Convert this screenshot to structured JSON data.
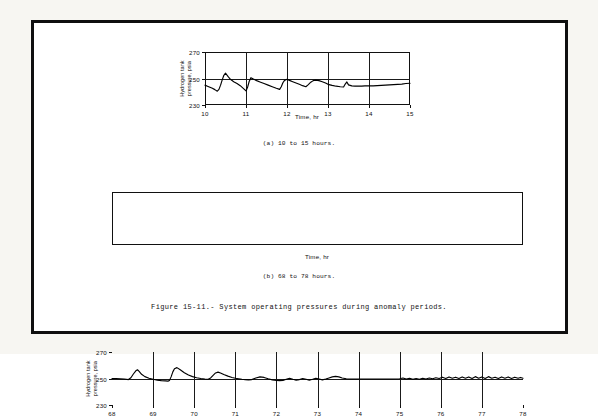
{
  "document": {
    "caption": "Figure 15-11.- System operating pressures during anomaly periods."
  },
  "chart_data": [
    {
      "id": "chart-a",
      "type": "line",
      "title": "",
      "subcaption": "(a) 10 to 15 hours.",
      "xlabel": "Time, hr",
      "ylabel": "Hydrogen tank pressure, psia",
      "ylabel_line1": "Hydrogen tank",
      "ylabel_line2": "pressure, psia",
      "xlim": [
        10,
        15
      ],
      "ylim": [
        230,
        270
      ],
      "xticks": [
        10,
        11,
        12,
        13,
        14,
        15
      ],
      "yticks": [
        230,
        250,
        270
      ],
      "grid": "vertical-at-xticks plus horizontal at 250",
      "series_name": "Hydrogen tank pressure",
      "x": [
        10.0,
        10.06,
        10.12,
        10.18,
        10.24,
        10.3,
        10.34,
        10.38,
        10.42,
        10.46,
        10.5,
        10.56,
        10.62,
        10.7,
        10.78,
        10.86,
        10.94,
        11.0,
        11.04,
        11.08,
        11.12,
        11.18,
        11.26,
        11.34,
        11.44,
        11.54,
        11.64,
        11.74,
        11.82,
        11.86,
        11.9,
        11.94,
        12.0,
        12.06,
        12.14,
        12.22,
        12.3,
        12.38,
        12.46,
        12.52,
        12.58,
        12.64,
        12.7,
        12.78,
        12.86,
        12.94,
        13.0,
        13.1,
        13.2,
        13.3,
        13.38,
        13.42,
        13.46,
        13.5,
        13.58,
        13.66,
        13.74,
        13.82,
        13.9,
        14.0,
        14.1,
        14.2,
        14.3,
        14.4,
        14.5,
        14.6,
        14.7,
        14.8,
        14.9,
        15.0
      ],
      "y": [
        245.0,
        244.2,
        243.4,
        242.6,
        241.6,
        240.4,
        241.8,
        245.0,
        249.0,
        252.4,
        254.0,
        251.6,
        249.4,
        247.6,
        246.2,
        244.6,
        242.4,
        240.6,
        243.6,
        248.0,
        250.6,
        249.6,
        248.4,
        247.4,
        246.2,
        245.0,
        243.8,
        242.6,
        241.8,
        243.8,
        246.8,
        248.6,
        249.4,
        248.6,
        247.6,
        246.6,
        245.6,
        244.6,
        243.8,
        245.4,
        247.2,
        248.4,
        248.8,
        248.4,
        247.6,
        246.6,
        245.6,
        244.8,
        244.2,
        243.8,
        243.6,
        245.8,
        247.4,
        245.2,
        244.4,
        244.2,
        244.2,
        244.2,
        244.4,
        244.4,
        244.4,
        244.6,
        244.8,
        245.0,
        245.2,
        245.4,
        245.6,
        245.8,
        246.2,
        246.4
      ]
    },
    {
      "id": "chart-b",
      "type": "line",
      "title": "",
      "subcaption": "(b) 68 to 78 hours.",
      "xlabel": "Time, hr",
      "ylabel": "Hydrogen tank pressure, psia",
      "ylabel_line1": "Hydrogen tank",
      "ylabel_line2": "pressure, psia",
      "xlim": [
        68,
        78
      ],
      "ylim": [
        230,
        270
      ],
      "xticks": [
        68,
        69,
        70,
        71,
        72,
        73,
        74,
        75,
        76,
        77,
        78
      ],
      "yticks": [
        230,
        250,
        270
      ],
      "grid": "vertical-at-xticks plus horizontal at 250",
      "series_name": "Hydrogen tank pressure",
      "x": [
        68.0,
        68.1,
        68.2,
        68.3,
        68.4,
        68.46,
        68.52,
        68.58,
        68.62,
        68.66,
        68.72,
        68.8,
        68.9,
        69.0,
        69.1,
        69.2,
        69.3,
        69.36,
        69.4,
        69.44,
        69.48,
        69.52,
        69.58,
        69.66,
        69.76,
        69.86,
        69.96,
        70.06,
        70.16,
        70.26,
        70.34,
        70.4,
        70.46,
        70.52,
        70.58,
        70.64,
        70.72,
        70.82,
        70.92,
        71.0,
        71.08,
        71.16,
        71.24,
        71.32,
        71.4,
        71.5,
        71.6,
        71.7,
        71.8,
        71.9,
        72.0,
        72.08,
        72.16,
        72.24,
        72.32,
        72.4,
        72.48,
        72.56,
        72.64,
        72.72,
        72.8,
        72.88,
        72.96,
        73.04,
        73.12,
        73.2,
        73.28,
        73.36,
        73.44,
        73.52,
        73.6,
        73.7,
        73.8,
        73.9,
        74.0,
        74.2,
        74.4,
        74.6,
        74.8,
        75.0,
        75.08,
        75.16,
        75.24,
        75.32,
        75.4,
        75.48,
        75.56,
        75.64,
        75.72,
        75.8,
        75.88,
        75.96,
        76.04,
        76.12,
        76.2,
        76.28,
        76.36,
        76.44,
        76.52,
        76.6,
        76.68,
        76.76,
        76.84,
        76.92,
        77.0,
        77.08,
        77.16,
        77.24,
        77.32,
        77.4,
        77.48,
        77.56,
        77.64,
        77.72,
        77.8,
        77.88,
        77.94,
        78.0
      ],
      "y": [
        250.0,
        250.0,
        249.8,
        249.6,
        249.2,
        250.6,
        253.4,
        255.8,
        256.6,
        255.4,
        253.2,
        251.4,
        250.2,
        249.4,
        248.8,
        248.4,
        248.2,
        248.0,
        248.6,
        251.4,
        255.0,
        257.4,
        258.2,
        256.6,
        254.4,
        252.6,
        251.4,
        250.6,
        250.0,
        249.6,
        249.4,
        250.4,
        252.4,
        254.2,
        254.8,
        254.2,
        253.0,
        251.8,
        250.8,
        250.2,
        249.8,
        249.4,
        249.2,
        249.0,
        249.2,
        250.4,
        251.2,
        250.8,
        249.8,
        249.0,
        248.6,
        248.4,
        248.6,
        249.4,
        250.2,
        249.4,
        248.8,
        249.2,
        250.0,
        249.4,
        248.8,
        249.4,
        250.2,
        249.6,
        249.0,
        249.6,
        250.4,
        251.2,
        251.6,
        251.2,
        250.4,
        249.8,
        249.6,
        249.6,
        249.6,
        249.6,
        249.6,
        249.6,
        249.6,
        249.8,
        250.4,
        249.6,
        250.2,
        249.4,
        250.0,
        249.4,
        250.2,
        249.6,
        250.4,
        249.8,
        250.6,
        250.0,
        251.0,
        250.0,
        251.2,
        250.2,
        251.0,
        250.0,
        251.2,
        250.2,
        251.2,
        250.0,
        251.4,
        250.2,
        251.2,
        250.0,
        251.4,
        250.2,
        251.0,
        250.0,
        251.2,
        250.2,
        251.2,
        250.0,
        251.0,
        250.2,
        250.8,
        250.2
      ]
    }
  ]
}
